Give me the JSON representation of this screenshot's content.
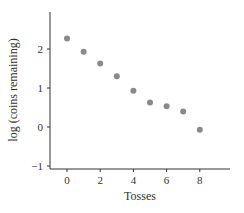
{
  "chart_data": {
    "type": "scatter",
    "title": "",
    "xlabel": "Tosses",
    "ylabel": "log (coins remaining)",
    "xlim": [
      -1,
      10
    ],
    "ylim": [
      -1.1,
      2.9
    ],
    "xticks": [
      0,
      2,
      4,
      6,
      8
    ],
    "yticks": [
      -1,
      0,
      1,
      2
    ],
    "xtick_labels": [
      "0",
      "2",
      "4",
      "6",
      "8"
    ],
    "ytick_labels": [
      "−1",
      "0",
      "1",
      "2"
    ],
    "grid": false,
    "legend": null,
    "point_color": "#8a8a8a",
    "series": [
      {
        "name": "log (coins remaining)",
        "x": [
          0,
          1,
          2,
          3,
          4,
          5,
          6,
          7,
          8
        ],
        "y": [
          2.27,
          1.93,
          1.63,
          1.3,
          0.93,
          0.63,
          0.53,
          0.4,
          -0.07
        ]
      }
    ]
  }
}
